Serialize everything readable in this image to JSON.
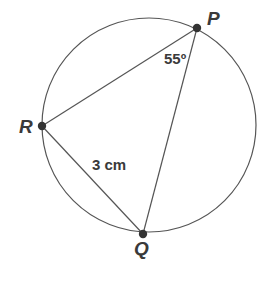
{
  "diagram": {
    "type": "circle-inscribed-triangle",
    "circle": {
      "cx": 149,
      "cy": 125,
      "r": 107,
      "stroke": "#555555"
    },
    "points": {
      "P": {
        "label": "P",
        "x": 197,
        "y": 28
      },
      "R": {
        "label": "R",
        "x": 42,
        "y": 126
      },
      "Q": {
        "label": "Q",
        "x": 143,
        "y": 234
      }
    },
    "segments": [
      {
        "from": "P",
        "to": "R"
      },
      {
        "from": "P",
        "to": "Q"
      },
      {
        "from": "R",
        "to": "Q"
      }
    ],
    "annotations": {
      "angle_P": "55º",
      "side_RQ": "3 cm"
    },
    "colors": {
      "line": "#555555",
      "point": "#333333",
      "text": "#3a3a3a"
    }
  }
}
